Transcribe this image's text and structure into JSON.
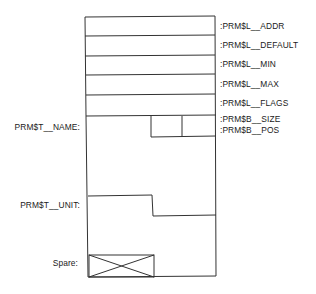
{
  "diagram": {
    "line_color": "#333333",
    "field_labels": [
      {
        "label": ":PRM$L__ADDR",
        "y": 22
      },
      {
        "label": ":PRM$L__DEFAULT",
        "y": 41
      },
      {
        "label": ":PRM$L__MIN",
        "y": 60
      },
      {
        "label": ":PRM$L__MAX",
        "y": 80
      },
      {
        "label": ":PRM$L__FLAGS",
        "y": 99
      },
      {
        "label": ":PRM$B__SIZE",
        "y": 115
      },
      {
        "label": ":PRM$B__POS",
        "y": 126
      }
    ],
    "left_labels": {
      "name": "PRM$T__NAME:",
      "unit": "PRM$T__UNIT:",
      "spare": "Spare:"
    }
  }
}
